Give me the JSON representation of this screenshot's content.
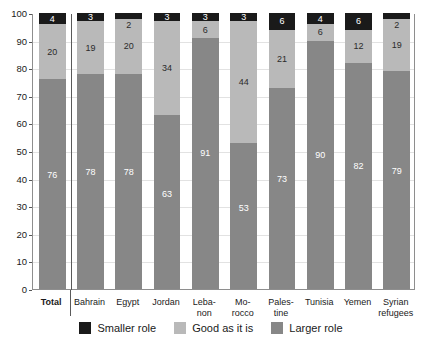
{
  "chart_data": {
    "type": "bar",
    "subtype": "stacked-bar-100",
    "title": "",
    "xlabel": "",
    "ylabel": "",
    "ylim": [
      0,
      100
    ],
    "ytick_step": 10,
    "yticks": [
      0,
      10,
      20,
      30,
      40,
      50,
      60,
      70,
      80,
      90,
      100
    ],
    "grid": true,
    "legend_position": "bottom",
    "categories": [
      "Total",
      "Bahrain",
      "Egypt",
      "Jordan",
      "Leba-\nnon",
      "Mo-\nrocco",
      "Pales-\ntine",
      "Tunisia",
      "Yemen",
      "Syrian\nrefugees"
    ],
    "series": [
      {
        "name": "Larger role",
        "color": "#878787",
        "values": [
          76,
          78,
          78,
          63,
          91,
          53,
          73,
          90,
          82,
          79
        ]
      },
      {
        "name": "Good as it is",
        "color": "#b9b9b9",
        "values": [
          20,
          19,
          20,
          34,
          6,
          44,
          21,
          6,
          12,
          19
        ]
      },
      {
        "name": "Smaller role",
        "color": "#1a1a1a",
        "values": [
          4,
          3,
          2,
          3,
          3,
          3,
          6,
          4,
          6,
          2
        ]
      }
    ]
  },
  "axis": {
    "y_tick_labels": [
      "100",
      "90",
      "80",
      "70",
      "60",
      "50",
      "40",
      "30",
      "20",
      "10",
      "0"
    ]
  },
  "x_labels": [
    {
      "line1": "Total",
      "line2": ""
    },
    {
      "line1": "Bahrain",
      "line2": ""
    },
    {
      "line1": "Egypt",
      "line2": ""
    },
    {
      "line1": "Jordan",
      "line2": ""
    },
    {
      "line1": "Leba-",
      "line2": "non"
    },
    {
      "line1": "Mo-",
      "line2": "rocco"
    },
    {
      "line1": "Pales-",
      "line2": "tine"
    },
    {
      "line1": "Tunisia",
      "line2": ""
    },
    {
      "line1": "Yemen",
      "line2": ""
    },
    {
      "line1": "Syrian",
      "line2": "refugees"
    }
  ],
  "legend": {
    "items": [
      {
        "label": "Smaller role",
        "color": "#1a1a1a"
      },
      {
        "label": "Good as it is",
        "color": "#b9b9b9"
      },
      {
        "label": "Larger role",
        "color": "#878787"
      }
    ]
  },
  "colors": {
    "smaller_role": "#1a1a1a",
    "good_as_it_is": "#b9b9b9",
    "larger_role": "#878787",
    "gridline": "#e2e2e2",
    "axis": "#8e8e8e",
    "background": "#ffffff"
  }
}
